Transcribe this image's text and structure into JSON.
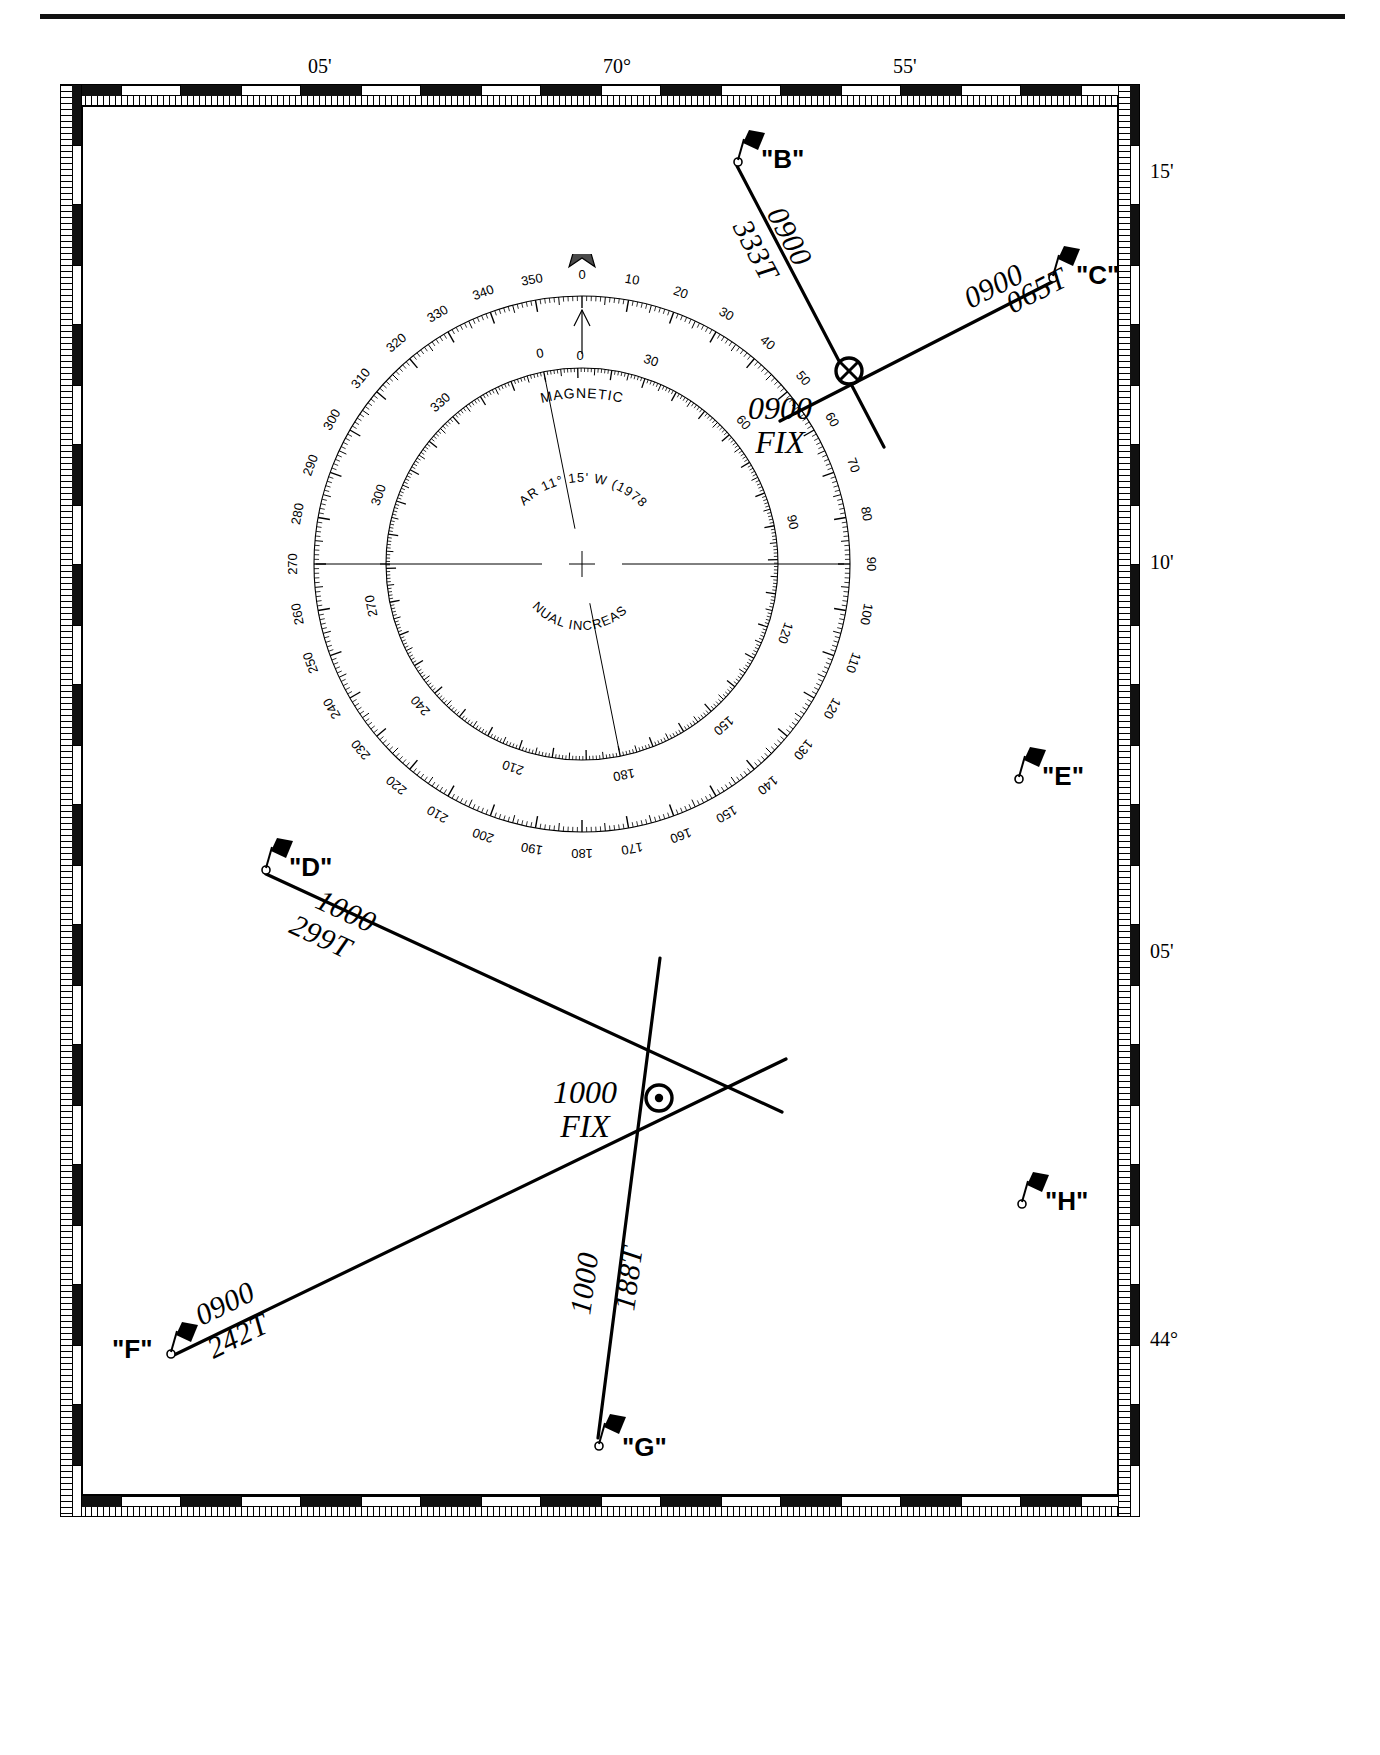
{
  "chart": {
    "scale_top_labels": [
      {
        "text": "05'",
        "x": 308
      },
      {
        "text": "70°",
        "x": 603
      },
      {
        "text": "55'",
        "x": 893
      }
    ],
    "scale_right_labels": [
      {
        "text": "15'",
        "y": 172
      },
      {
        "text": "10'",
        "y": 563
      },
      {
        "text": "05'",
        "y": 952
      },
      {
        "text": "44°",
        "y": 1340
      }
    ]
  },
  "compass_rose": {
    "magnetic_label": "MAGNETIC",
    "variation": "VAR 11° 15' W (1978)",
    "annual_increase": "ANNUAL INCREASE 1'",
    "true_north_star": "star-icon",
    "outer_ring_labels": [
      "0",
      "10",
      "20",
      "30",
      "40",
      "50",
      "60",
      "70",
      "80",
      "90",
      "100",
      "110",
      "120",
      "130",
      "140",
      "150",
      "160",
      "170",
      "180",
      "190",
      "200",
      "210",
      "220",
      "230",
      "240",
      "250",
      "260",
      "270",
      "280",
      "290",
      "300",
      "310",
      "320",
      "330",
      "340",
      "350"
    ],
    "inner_ring_labels": [
      "0",
      "30",
      "60",
      "90",
      "120",
      "150",
      "180",
      "210",
      "240",
      "270",
      "300",
      "330"
    ],
    "outer_ring_label_step": 10,
    "inner_ring_label_step": 30
  },
  "buoys": [
    {
      "id": "B",
      "label": "\"B\"",
      "x": 737,
      "y": 160,
      "label_dx": 24,
      "label_dy": -16
    },
    {
      "id": "C",
      "label": "\"C\"",
      "x": 1052,
      "y": 276,
      "label_dx": 24,
      "label_dy": -16
    },
    {
      "id": "D",
      "label": "\"D\"",
      "x": 265,
      "y": 868,
      "label_dx": 24,
      "label_dy": -16
    },
    {
      "id": "E",
      "label": "\"E\"",
      "x": 1018,
      "y": 777,
      "label_dx": 24,
      "label_dy": -16
    },
    {
      "id": "F",
      "label": "\"F\"",
      "x": 170,
      "y": 1352,
      "label_dx": -58,
      "label_dy": -18
    },
    {
      "id": "G",
      "label": "\"G\"",
      "x": 598,
      "y": 1444,
      "label_dx": 24,
      "label_dy": -12
    },
    {
      "id": "H",
      "label": "\"H\"",
      "x": 1021,
      "y": 1202,
      "label_dx": 24,
      "label_dy": -16
    }
  ],
  "bearing_lines": [
    {
      "from": "B",
      "time": "0900",
      "bearing": "333T",
      "x1": 737,
      "y1": 166,
      "x2": 884,
      "y2": 447
    },
    {
      "from": "C",
      "time": "0900",
      "bearing": "065T",
      "x1": 1052,
      "y1": 282,
      "x2": 780,
      "y2": 421
    },
    {
      "from": "D",
      "time": "1000",
      "bearing": "299T",
      "x1": 266,
      "y1": 874,
      "x2": 782,
      "y2": 1112
    },
    {
      "from": "F",
      "time": "0900",
      "bearing": "242T",
      "x1": 172,
      "y1": 1356,
      "x2": 786,
      "y2": 1059
    },
    {
      "from": "G",
      "time": "1000",
      "bearing": "188T",
      "x1": 598,
      "y1": 1438,
      "x2": 660,
      "y2": 958
    }
  ],
  "bearing_labels": [
    {
      "id": "b-0900",
      "text": "0900",
      "x": 775,
      "y": 192,
      "rot": 62
    },
    {
      "id": "b-333t",
      "text": "333T",
      "x": 741,
      "y": 205,
      "rot": 62
    },
    {
      "id": "c-0900",
      "text": "0900",
      "x": 966,
      "y": 283,
      "rot": -27
    },
    {
      "id": "c-065t",
      "text": "065T",
      "x": 1008,
      "y": 288,
      "rot": -27
    },
    {
      "id": "d-1000",
      "text": "1000",
      "x": 318,
      "y": 881,
      "rot": 25
    },
    {
      "id": "d-299t",
      "text": "299T",
      "x": 292,
      "y": 906,
      "rot": 25
    },
    {
      "id": "f-0900",
      "text": "0900",
      "x": 197,
      "y": 1300,
      "rot": -26
    },
    {
      "id": "f-242t",
      "text": "242T",
      "x": 209,
      "y": 1333,
      "rot": -26
    },
    {
      "id": "g-1000",
      "text": "1000",
      "x": 580,
      "y": 1297,
      "rot": -82
    },
    {
      "id": "g-188t",
      "text": "188T",
      "x": 624,
      "y": 1293,
      "rot": -82
    }
  ],
  "fixes": [
    {
      "id": "fix-0900",
      "time": "0900",
      "label": "FIX",
      "marker": "crossed-circle",
      "x": 849,
      "y": 371,
      "label_x": 748,
      "label_y": 392
    },
    {
      "id": "fix-1000",
      "time": "1000",
      "label": "FIX",
      "marker": "dot-circle",
      "x": 659,
      "y": 1098,
      "label_x": 553,
      "label_y": 1076
    }
  ]
}
